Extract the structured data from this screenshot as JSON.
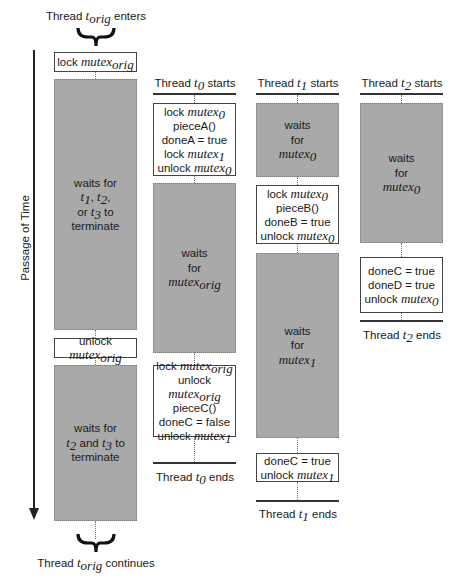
{
  "time_axis": {
    "label": "Passage of Time"
  },
  "orig": {
    "enter_label": {
      "pre": "Thread ",
      "var": "t",
      "sub": "orig",
      "post": " enters"
    },
    "continue_label": {
      "pre": "Thread ",
      "var": "t",
      "sub": "orig",
      "post": " continues"
    },
    "lock_box": {
      "pre": "lock ",
      "var": "mutex",
      "sub": "orig"
    },
    "wait1": {
      "line1": "waits for",
      "t1": "t",
      "t1sub": "1",
      "t2": "t",
      "t2sub": "2",
      "or": "or ",
      "t3": "t",
      "t3sub": "3",
      "to": " to",
      "line4": "terminate"
    },
    "unlock_box": {
      "pre": "unlock ",
      "var": "mutex",
      "sub": "orig"
    },
    "wait2": {
      "line1": "waits for",
      "ta": "t",
      "tasub": "2",
      "and": " and ",
      "tb": "t",
      "tbsub": "3",
      "to": " to",
      "line3": "terminate"
    }
  },
  "t0": {
    "start": {
      "pre": "Thread ",
      "var": "t",
      "sub": "0",
      "post": " starts"
    },
    "box1": [
      {
        "pre": "lock ",
        "var": "mutex",
        "sub": "0"
      },
      {
        "pre": "pieceA()"
      },
      {
        "pre": "doneA = true"
      },
      {
        "pre": "lock ",
        "var": "mutex",
        "sub": "1"
      },
      {
        "pre": "unlock ",
        "var": "mutex",
        "sub": "0"
      }
    ],
    "wait": {
      "line1": "waits",
      "line2": "for",
      "var": "mutex",
      "sub": "orig"
    },
    "box2": [
      {
        "pre": "lock ",
        "var": "mutex",
        "sub": "orig"
      },
      {
        "pre": "unlock ",
        "var": "mutex",
        "sub": "orig"
      },
      {
        "pre": "pieceC()"
      },
      {
        "pre": "doneC = false"
      },
      {
        "pre": "unlock ",
        "var": "mutex",
        "sub": "1"
      }
    ],
    "end": {
      "pre": "Thread ",
      "var": "t",
      "sub": "0",
      "post": " ends"
    }
  },
  "t1": {
    "start": {
      "pre": "Thread ",
      "var": "t",
      "sub": "1",
      "post": " starts"
    },
    "wait1": {
      "line1": "waits",
      "line2": "for",
      "var": "mutex",
      "sub": "0"
    },
    "box1": [
      {
        "pre": "lock ",
        "var": "mutex",
        "sub": "0"
      },
      {
        "pre": "pieceB()"
      },
      {
        "pre": "doneB = true"
      },
      {
        "pre": "unlock ",
        "var": "mutex",
        "sub": "0"
      }
    ],
    "wait2": {
      "line1": "waits",
      "line2": "for",
      "var": "mutex",
      "sub": "1"
    },
    "box2": [
      {
        "pre": "doneC = true"
      },
      {
        "pre": "unlock ",
        "var": "mutex",
        "sub": "1"
      }
    ],
    "end": {
      "pre": "Thread ",
      "var": "t",
      "sub": "1",
      "post": " ends"
    }
  },
  "t2": {
    "start": {
      "pre": "Thread ",
      "var": "t",
      "sub": "2",
      "post": " starts"
    },
    "wait1": {
      "line1": "waits",
      "line2": "for",
      "var": "mutex",
      "sub": "0"
    },
    "box1": [
      {
        "pre": "doneC = true"
      },
      {
        "pre": "doneD = true"
      },
      {
        "pre": "unlock ",
        "var": "mutex",
        "sub": "0"
      }
    ],
    "end": {
      "pre": "Thread ",
      "var": "t",
      "sub": "2",
      "post": " ends"
    }
  },
  "colors": {
    "wait_fill": "#a9a9a9",
    "box_border": "#444444",
    "line": "#333333"
  }
}
